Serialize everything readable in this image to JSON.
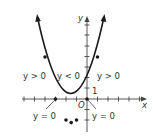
{
  "diagram": {
    "type": "parabola-sign-chart",
    "equation_implied": "y = x^2 + 3x",
    "axes": {
      "x_label": "x",
      "y_label": "y",
      "origin_label": "O",
      "unit_label": "1"
    },
    "regions": [
      {
        "id": "left-positive",
        "label": "y > 0"
      },
      {
        "id": "middle-negative",
        "label": "y < 0"
      },
      {
        "id": "right-positive",
        "label": "y > 0"
      }
    ],
    "roots": [
      {
        "x": -3,
        "label": "y = 0"
      },
      {
        "x": 0,
        "label": "y = 0"
      }
    ],
    "points": [
      {
        "x": -4,
        "y": 4
      },
      {
        "x": -2,
        "y": -2
      },
      {
        "x": -1.5,
        "y": -2.25
      },
      {
        "x": -1,
        "y": -2
      },
      {
        "x": 1,
        "y": 4
      }
    ],
    "colors": {
      "curve": "#1a1a1a",
      "axis": "#444444",
      "text": "#333333"
    }
  }
}
